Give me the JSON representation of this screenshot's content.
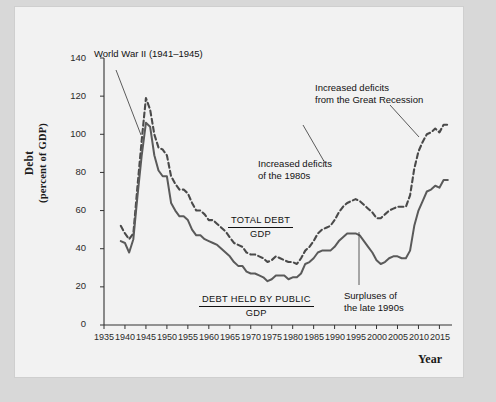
{
  "chart_data": {
    "type": "line",
    "title": "",
    "xlabel": "Year",
    "ylabel_line1": "Debt",
    "ylabel_line2": "(percent of GDP)",
    "ylim": [
      0,
      140
    ],
    "xlim": [
      1935,
      2018
    ],
    "yticks": [
      0,
      20,
      40,
      60,
      80,
      100,
      120,
      140
    ],
    "xticks": [
      1935,
      1940,
      1945,
      1950,
      1955,
      1960,
      1965,
      1970,
      1975,
      1980,
      1985,
      1990,
      1995,
      2000,
      2005,
      2010,
      2015
    ],
    "grid": false,
    "legend_position": "inline-annotations",
    "series": [
      {
        "name": "TOTAL DEBT / GDP",
        "style": "dashed",
        "color": "#4a4a4a",
        "x": [
          1939,
          1940,
          1941,
          1942,
          1943,
          1944,
          1945,
          1946,
          1947,
          1948,
          1949,
          1950,
          1951,
          1952,
          1953,
          1954,
          1955,
          1956,
          1957,
          1958,
          1959,
          1960,
          1961,
          1962,
          1963,
          1964,
          1965,
          1966,
          1967,
          1968,
          1969,
          1970,
          1971,
          1972,
          1973,
          1974,
          1975,
          1976,
          1977,
          1978,
          1979,
          1980,
          1981,
          1982,
          1983,
          1984,
          1985,
          1986,
          1987,
          1988,
          1989,
          1990,
          1991,
          1992,
          1993,
          1994,
          1995,
          1996,
          1997,
          1998,
          1999,
          2000,
          2001,
          2002,
          2003,
          2004,
          2005,
          2006,
          2007,
          2008,
          2009,
          2010,
          2011,
          2012,
          2013,
          2014,
          2015,
          2016,
          2017
        ],
        "y": [
          52,
          48,
          45,
          48,
          73,
          97,
          119,
          113,
          100,
          93,
          92,
          89,
          78,
          74,
          71,
          71,
          69,
          64,
          60,
          60,
          58,
          55,
          55,
          53,
          51,
          49,
          46,
          43,
          42,
          41,
          38,
          37,
          37,
          36,
          35,
          33,
          34,
          36,
          35,
          34,
          33,
          33,
          32,
          35,
          39,
          41,
          44,
          48,
          50,
          51,
          52,
          55,
          59,
          62,
          64,
          65,
          66,
          65,
          63,
          61,
          59,
          56,
          56,
          58,
          60,
          61,
          62,
          62,
          62,
          68,
          82,
          91,
          96,
          100,
          101,
          103,
          101,
          105,
          105
        ]
      },
      {
        "name": "DEBT HELD BY PUBLIC / GDP",
        "style": "solid",
        "color": "#5a5a5a",
        "x": [
          1939,
          1940,
          1941,
          1942,
          1943,
          1944,
          1945,
          1946,
          1947,
          1948,
          1949,
          1950,
          1951,
          1952,
          1953,
          1954,
          1955,
          1956,
          1957,
          1958,
          1959,
          1960,
          1961,
          1962,
          1963,
          1964,
          1965,
          1966,
          1967,
          1968,
          1969,
          1970,
          1971,
          1972,
          1973,
          1974,
          1975,
          1976,
          1977,
          1978,
          1979,
          1980,
          1981,
          1982,
          1983,
          1984,
          1985,
          1986,
          1987,
          1988,
          1989,
          1990,
          1991,
          1992,
          1993,
          1994,
          1995,
          1996,
          1997,
          1998,
          1999,
          2000,
          2001,
          2002,
          2003,
          2004,
          2005,
          2006,
          2007,
          2008,
          2009,
          2010,
          2011,
          2012,
          2013,
          2014,
          2015,
          2016,
          2017
        ],
        "y": [
          44,
          43,
          38,
          45,
          68,
          89,
          106,
          104,
          89,
          81,
          78,
          78,
          64,
          60,
          57,
          57,
          55,
          50,
          47,
          47,
          45,
          44,
          43,
          42,
          40,
          38,
          36,
          33,
          31,
          31,
          28,
          27,
          27,
          26,
          25,
          23,
          24,
          26,
          26,
          26,
          24,
          25,
          25,
          27,
          32,
          33,
          35,
          38,
          39,
          39,
          39,
          41,
          44,
          46,
          48,
          48,
          48,
          47,
          44,
          41,
          38,
          34,
          32,
          33,
          35,
          36,
          36,
          35,
          35,
          39,
          52,
          60,
          65,
          70,
          71,
          73,
          72,
          76,
          76
        ]
      }
    ],
    "annotations": [
      {
        "name": "world-war-2",
        "text": "World War II (1941–1945)",
        "x": 1942,
        "y": 125
      },
      {
        "name": "deficits-1980s",
        "text": "Increased deficits\nof the 1980s",
        "x": 1975,
        "y": 88
      },
      {
        "name": "great-recession",
        "text": "Increased deficits\nfrom the Great Recession",
        "x": 1993,
        "y": 120
      },
      {
        "name": "surpluses-1990s",
        "text": "Surpluses of\nthe late 1990s",
        "x": 2000,
        "y": 22
      },
      {
        "name": "total-debt-label",
        "numerator": "TOTAL DEBT",
        "denominator": "GDP",
        "x": 1973,
        "y": 55
      },
      {
        "name": "public-debt-label",
        "numerator": "DEBT HELD BY PUBLIC",
        "denominator": "GDP",
        "x": 1976,
        "y": 18
      }
    ],
    "colors": {
      "line": "#4f4f4f",
      "axis": "#333333",
      "text": "#111111",
      "sheet_background": "#f2f2f2",
      "page_background": "#d8d8d8",
      "plot_background": "#ffffff"
    }
  }
}
